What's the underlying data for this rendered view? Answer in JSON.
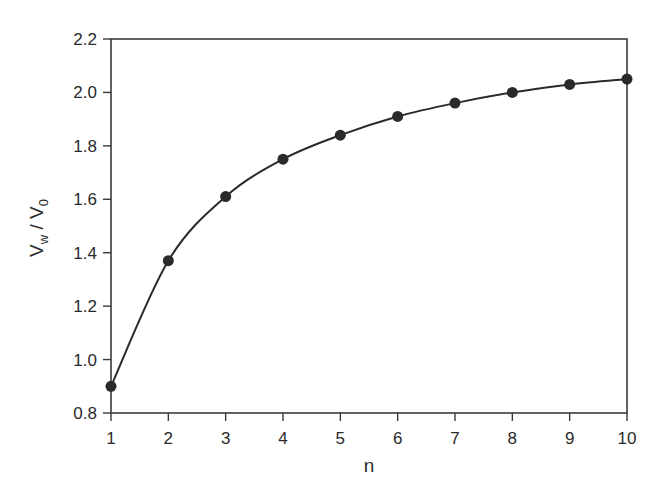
{
  "chart_data": {
    "type": "line",
    "title": "",
    "xlabel": "n",
    "ylabel": "V_w / V_0",
    "ylabel_parts": {
      "main1": "V",
      "sub1": "w",
      "sep": " / ",
      "main2": "V",
      "sub2": "0"
    },
    "x": [
      1,
      2,
      3,
      4,
      5,
      6,
      7,
      8,
      9,
      10
    ],
    "series": [
      {
        "name": "V_w / V_0",
        "values": [
          0.9,
          1.37,
          1.61,
          1.75,
          1.84,
          1.91,
          1.96,
          2.0,
          2.03,
          2.05
        ],
        "marker": "circle",
        "smooth": true,
        "color": "#2a2a2a"
      }
    ],
    "xlim": [
      1,
      10
    ],
    "ylim": [
      0.8,
      2.2
    ],
    "xticks": [
      "1",
      "2",
      "3",
      "4",
      "5",
      "6",
      "7",
      "8",
      "9",
      "10"
    ],
    "yticks": [
      "0.8",
      "1.0",
      "1.2",
      "1.4",
      "1.6",
      "1.8",
      "2.0",
      "2.2"
    ],
    "grid": false,
    "legend": null
  }
}
